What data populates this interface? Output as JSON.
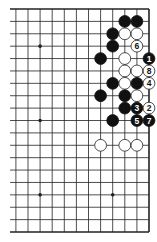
{
  "diagram": {
    "type": "go-board-partial",
    "view": "right half of 19x19 board",
    "colors": {
      "background": "#ffffff",
      "grid": "#222222",
      "black_stone": "#111111",
      "white_stone": "#ffffff",
      "white_outline": "#222222"
    },
    "grid": {
      "right_x": 149,
      "col_spacing": 12.1,
      "visible_cols": 12,
      "top_y": 9,
      "row_spacing": 12.39,
      "rows": 19,
      "left_stub_x": 10
    },
    "star_points": [
      {
        "k": 9,
        "r": 3
      },
      {
        "k": 9,
        "r": 9
      },
      {
        "k": 9,
        "r": 15
      },
      {
        "k": 3,
        "r": 15
      }
    ],
    "stones": [
      {
        "color": "black",
        "k": 2,
        "r": 1,
        "label": ""
      },
      {
        "color": "black",
        "k": 1,
        "r": 1,
        "label": ""
      },
      {
        "color": "black",
        "k": 3,
        "r": 2,
        "label": ""
      },
      {
        "color": "white",
        "k": 2,
        "r": 2,
        "label": ""
      },
      {
        "color": "white",
        "k": 1,
        "r": 2,
        "label": ""
      },
      {
        "color": "black",
        "k": 3,
        "r": 3,
        "label": ""
      },
      {
        "color": "white",
        "k": 1,
        "r": 3,
        "label": "6"
      },
      {
        "color": "black",
        "k": 4,
        "r": 4,
        "label": ""
      },
      {
        "color": "white",
        "k": 2,
        "r": 4,
        "label": ""
      },
      {
        "color": "black",
        "k": 0,
        "r": 4,
        "label": "1"
      },
      {
        "color": "white",
        "k": 2,
        "r": 5,
        "label": ""
      },
      {
        "color": "white",
        "k": 1,
        "r": 5,
        "label": ""
      },
      {
        "color": "white",
        "k": 0,
        "r": 5,
        "label": "8"
      },
      {
        "color": "black",
        "k": 3,
        "r": 6,
        "label": ""
      },
      {
        "color": "white",
        "k": 2,
        "r": 6,
        "label": ""
      },
      {
        "color": "black",
        "k": 1,
        "r": 6,
        "label": ""
      },
      {
        "color": "white",
        "k": 0,
        "r": 6,
        "label": "4"
      },
      {
        "color": "black",
        "k": 4,
        "r": 7,
        "label": ""
      },
      {
        "color": "black",
        "k": 2,
        "r": 7,
        "label": ""
      },
      {
        "color": "white",
        "k": 1,
        "r": 7,
        "label": ""
      },
      {
        "color": "black",
        "k": 2,
        "r": 8,
        "label": ""
      },
      {
        "color": "black",
        "k": 1,
        "r": 8,
        "label": "3"
      },
      {
        "color": "white",
        "k": 0,
        "r": 8,
        "label": "2"
      },
      {
        "color": "black",
        "k": 3,
        "r": 9,
        "label": ""
      },
      {
        "color": "black",
        "k": 1,
        "r": 9,
        "label": "5"
      },
      {
        "color": "black",
        "k": 0,
        "r": 9,
        "label": "7"
      },
      {
        "color": "white",
        "k": 4,
        "r": 11,
        "label": ""
      },
      {
        "color": "white",
        "k": 2,
        "r": 11,
        "label": ""
      },
      {
        "color": "white",
        "k": 1,
        "r": 11,
        "label": ""
      }
    ],
    "move_sequence": [
      "1",
      "2",
      "3",
      "4",
      "5",
      "6",
      "7",
      "8"
    ]
  }
}
